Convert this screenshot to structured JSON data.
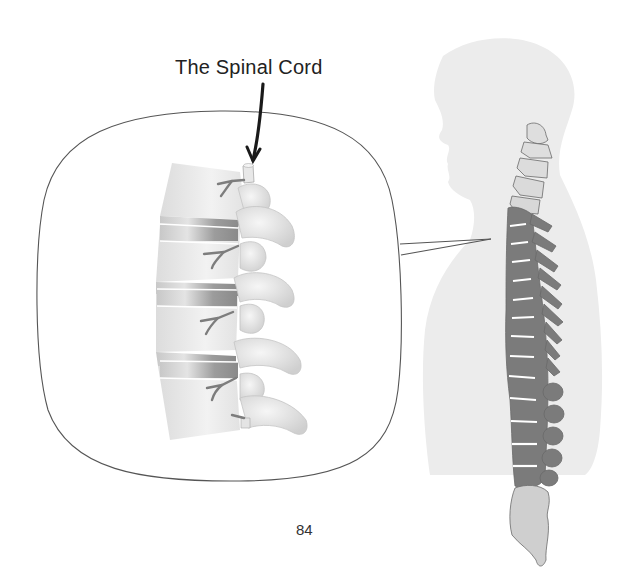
{
  "diagram": {
    "title_label": "The Spinal Cord",
    "page_number": "84",
    "callout": {
      "shape": "rounded-square magnifier",
      "content": "lumbar vertebrae side view with intervertebral discs and nerve roots",
      "pointer": "arrow pointing to spinal cord at top of vertebral column"
    },
    "figure": {
      "subject": "human head and torso silhouette in profile",
      "spine_regions": [
        {
          "name": "cervical",
          "color": "#d9d9d9"
        },
        {
          "name": "thoracic-lumbar",
          "color": "#7a7a7a"
        },
        {
          "name": "sacrum",
          "color": "#cfcfcf"
        }
      ]
    },
    "colors": {
      "silhouette": "#ececec",
      "vertebra_light": "#e6e6e6",
      "vertebra_dark": "#7b7b7b",
      "disc_dark": "#9a9a9a",
      "outline": "#555555",
      "text": "#222222"
    }
  }
}
